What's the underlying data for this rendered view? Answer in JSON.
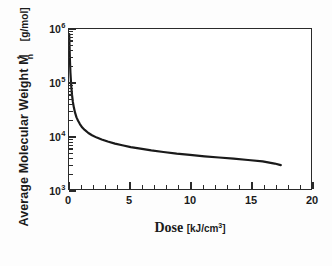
{
  "chart_data": {
    "type": "line",
    "title": "",
    "xlabel": "Dose [kJ/cm3]",
    "xlabel_main": "Dose",
    "xlabel_units_pre": "[kJ/cm",
    "xlabel_units_exp": "3",
    "xlabel_units_post": "]",
    "ylabel": "Average Molecular Weight M*n [g/mol]",
    "ylabel_main": "Average Molecular Weight",
    "ylabel_symbol": "M",
    "ylabel_symbol_sup": "*",
    "ylabel_symbol_sub": "n",
    "ylabel_units": "[g/mol]",
    "xscale": "linear",
    "yscale": "log",
    "xlim": [
      0,
      20
    ],
    "ylim": [
      1000,
      1000000
    ],
    "grid": false,
    "legend": "none",
    "xticks": [
      0,
      5,
      10,
      15,
      20
    ],
    "xtick_labels": [
      "0",
      "5",
      "10",
      "15",
      "20"
    ],
    "x_minor_tick_step": 1,
    "yticks": [
      1000,
      10000,
      100000,
      1000000
    ],
    "ytick_labels": [
      "10",
      "10",
      "10",
      "10"
    ],
    "ytick_exponents": [
      "3",
      "4",
      "5",
      "6"
    ],
    "line_color": "#1a1a1a",
    "line_width": 2.2,
    "series": [
      {
        "name": "Average Molecular Weight vs Dose",
        "x": [
          0.02,
          0.05,
          0.08,
          0.12,
          0.18,
          0.25,
          0.32,
          0.4,
          0.5,
          0.62,
          0.75,
          0.9,
          1.1,
          1.3,
          1.6,
          1.9,
          2.3,
          2.7,
          3.2,
          3.8,
          4.4,
          5.1,
          5.9,
          6.8,
          7.8,
          8.9,
          10.0,
          11.2,
          12.4,
          13.6,
          14.8,
          16.0,
          17.0,
          17.5
        ],
        "y": [
          800000,
          420000,
          250000,
          150000,
          88000,
          58000,
          43000,
          34000,
          27000,
          22000,
          19000,
          16500,
          14200,
          12800,
          11200,
          10200,
          9200,
          8500,
          7800,
          7100,
          6600,
          6100,
          5700,
          5300,
          4950,
          4600,
          4350,
          4100,
          3900,
          3700,
          3500,
          3300,
          3000,
          2800
        ]
      }
    ]
  }
}
